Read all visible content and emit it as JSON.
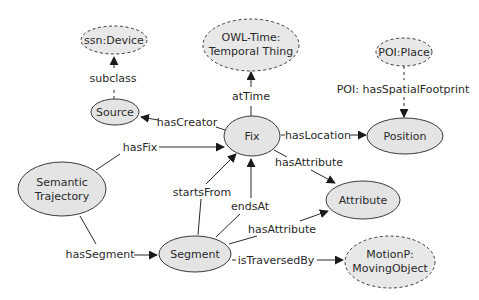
{
  "diagram": {
    "type": "ontology-graph",
    "colors": {
      "node_fill": "#e4e4e4",
      "node_stroke": "#3a3a3a",
      "text": "#2a2a2a",
      "background": "#ffffff"
    },
    "nodes": {
      "ssn_device": {
        "label": "ssn:Device",
        "style": "dashed"
      },
      "owl_time": {
        "line1": "OWL-Time:",
        "line2": "Temporal Thing",
        "style": "dashed"
      },
      "poi_place": {
        "label": "POI:Place",
        "style": "dashed"
      },
      "source": {
        "label": "Source",
        "style": "solid"
      },
      "fix": {
        "label": "Fix",
        "style": "solid"
      },
      "position": {
        "label": "Position",
        "style": "solid"
      },
      "semantic_trajectory": {
        "line1": "Semantic",
        "line2": "Trajectory",
        "style": "solid"
      },
      "attribute": {
        "label": "Attribute",
        "style": "solid"
      },
      "segment": {
        "label": "Segment",
        "style": "solid"
      },
      "motionp": {
        "line1": "MotionP:",
        "line2": "MovingObject",
        "style": "dashed"
      }
    },
    "edges": {
      "subclass": {
        "label": "subclass",
        "from": "Source",
        "to": "ssn:Device"
      },
      "hasCreator": {
        "label": "hasCreator",
        "from": "Fix",
        "to": "Source"
      },
      "atTime": {
        "label": "atTime",
        "from": "Fix",
        "to": "OWL-Time: Temporal Thing"
      },
      "hasLocation": {
        "label": "hasLocation",
        "from": "Fix",
        "to": "Position"
      },
      "poi_footprint": {
        "label": "POI: hasSpatialFootprint",
        "from": "POI:Place",
        "to": "Position"
      },
      "hasFix": {
        "label": "hasFix",
        "from": "Semantic Trajectory",
        "to": "Fix"
      },
      "fix_hasAttribute": {
        "label": "hasAttribute",
        "from": "Fix",
        "to": "Attribute"
      },
      "startsFrom": {
        "label": "startsFrom",
        "from": "Segment",
        "to": "Fix"
      },
      "endsAt": {
        "label": "endsAt",
        "from": "Segment",
        "to": "Fix"
      },
      "segment_hasAttribute": {
        "label": "hasAttribute",
        "from": "Segment",
        "to": "Attribute"
      },
      "hasSegment": {
        "label": "hasSegment",
        "from": "Semantic Trajectory",
        "to": "Segment"
      },
      "isTraversedBy": {
        "label": "isTraversedBy",
        "from": "Segment",
        "to": "MotionP: MovingObject"
      }
    }
  }
}
